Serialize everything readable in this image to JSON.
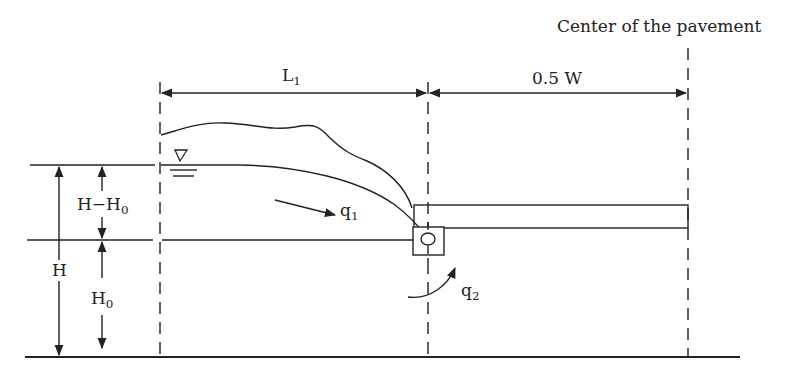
{
  "diagram": {
    "title_label": "Center of the pavement",
    "dimensions": {
      "L1": {
        "base": "L",
        "sub": "1"
      },
      "half_width": "0.5 W",
      "H": "H",
      "H_minus_H0": {
        "base": "H−H",
        "sub": "0"
      },
      "H0": {
        "base": "H",
        "sub": "0"
      }
    },
    "flows": {
      "q1": {
        "base": "q",
        "sub": "1"
      },
      "q2": {
        "base": "q",
        "sub": "2"
      }
    },
    "symbols": {
      "water_table": "water-table-triangle"
    },
    "colors": {
      "line": "#222222",
      "background": "#ffffff"
    }
  }
}
